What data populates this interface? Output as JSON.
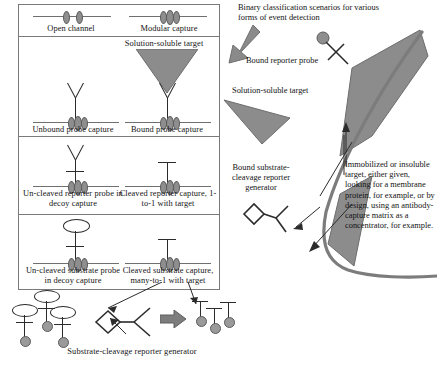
{
  "figure": {
    "title": "Binary classification scenarios for various forms of event detection",
    "colors": {
      "channel": "#6f6f6f",
      "bead": "#8e8e8e",
      "probe": "#2b2b2b",
      "target_fill": "#8c8c8c",
      "arrow": "#7d7d7d",
      "border": "#7a7a7a",
      "background": "#ffffff"
    }
  },
  "matrix": {
    "rows": [
      {
        "id": "row-channel",
        "cells": [
          {
            "id": "open-channel",
            "label": "Open channel"
          },
          {
            "id": "modular-capture",
            "label": "Modular capture"
          }
        ]
      },
      {
        "id": "row-probe-capture",
        "heading": "Solution-soluble target",
        "cells": [
          {
            "id": "unbound-probe-capture",
            "label": "Unbound probe capture"
          },
          {
            "id": "bound-probe-capture",
            "label": "Bound probe capture"
          }
        ]
      },
      {
        "id": "row-reporter",
        "cells": [
          {
            "id": "uncleaved-reporter",
            "label": "Un-cleaved reporter probe in decoy capture"
          },
          {
            "id": "cleaved-reporter",
            "label": "Cleaved reporter capture, 1-to-1 with target"
          }
        ]
      },
      {
        "id": "row-substrate",
        "cells": [
          {
            "id": "uncleaved-substrate",
            "label": "Un-cleaved substrate probe in decoy capture"
          },
          {
            "id": "cleaved-substrate",
            "label": "Cleaved substrate capture, many-to-1 with target"
          }
        ]
      }
    ]
  },
  "reaction": {
    "caption": "Substrate-cleavage reporter generator",
    "arrow_glyph": "➡"
  },
  "scene": {
    "callout_title": "Binary classification scenarios for various forms of event detection",
    "labels": {
      "bound_reporter_probe": "Bound reporter probe",
      "solution_soluble_target": "Solution-soluble target",
      "bound_substrate_cleavage_reporter_generator": "Bound substrate-cleavage reporter generator",
      "immobilized_target_note": "Immobilized or insoluble target, either given, looking for a membrane protein, for example, or by design, using an antibody-capture matrix as a concentrator, for example."
    }
  }
}
